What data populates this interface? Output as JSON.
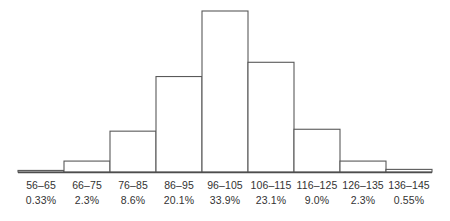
{
  "chart_data": {
    "type": "bar",
    "title": "",
    "subtitle": "",
    "xlabel": "",
    "ylabel": "",
    "categories": [
      "56–65",
      "66–75",
      "76–85",
      "86–95",
      "96–105",
      "106–115",
      "116–125",
      "126–135",
      "136–145"
    ],
    "values": [
      0.33,
      2.3,
      8.6,
      20.1,
      33.9,
      23.1,
      9.0,
      2.3,
      0.55
    ],
    "value_labels": [
      "0.33%",
      "2.3%",
      "8.6%",
      "20.1%",
      "33.9%",
      "23.1%",
      "9.0%",
      "2.3%",
      "0.55%"
    ],
    "unit": "%",
    "ylim": [
      0,
      33.9
    ],
    "grid": false,
    "legend": null,
    "legend_position": "none",
    "axis_visible": {
      "x": true,
      "y": false
    },
    "bar_fill_color": "#ffffff",
    "bar_stroke_color": "#595959",
    "axis_color": "#4d4d4d",
    "text_color": "#333333"
  },
  "axis": {
    "ticks": [
      {
        "range": "56–65",
        "percent": "0.33%"
      },
      {
        "range": "66–75",
        "percent": "2.3%"
      },
      {
        "range": "76–85",
        "percent": "8.6%"
      },
      {
        "range": "86–95",
        "percent": "20.1%"
      },
      {
        "range": "96–105",
        "percent": "33.9%"
      },
      {
        "range": "106–115",
        "percent": "23.1%"
      },
      {
        "range": "116–125",
        "percent": "9.0%"
      },
      {
        "range": "126–135",
        "percent": "2.3%"
      },
      {
        "range": "136–145",
        "percent": "0.55%"
      }
    ]
  }
}
